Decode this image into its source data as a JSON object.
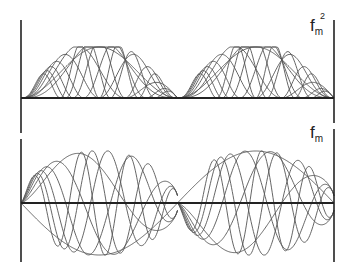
{
  "chart_data": {
    "type": "line",
    "panels": [
      {
        "name": "top",
        "label_base": "f",
        "label_sub": "m",
        "label_sup": "2",
        "description": "squared mode functions f_m^2 on two half-intervals",
        "x_range": [
          0,
          1
        ],
        "y_range": [
          0,
          1
        ],
        "frequencies": [
          1,
          2,
          3,
          4,
          5,
          6,
          7,
          8
        ],
        "baseline": 0
      },
      {
        "name": "bottom",
        "label_base": "f",
        "label_sub": "m",
        "label_sup": "",
        "description": "mode functions f_m on two half-intervals, odd about center",
        "x_range": [
          0,
          1
        ],
        "y_range": [
          -1,
          1
        ],
        "frequencies": [
          1,
          2,
          3,
          4,
          5,
          6,
          7
        ],
        "baseline": 0
      }
    ],
    "grid": false,
    "legend": "none"
  },
  "colors": {
    "axis": "#222222",
    "curve": "#555555",
    "background": "#ffffff"
  }
}
